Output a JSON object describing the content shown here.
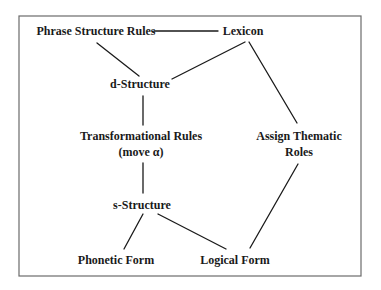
{
  "diagram": {
    "title": "",
    "frame": {
      "x": 19,
      "y": 16,
      "width": 342,
      "height": 260,
      "stroke": "#6b6b6b"
    },
    "nodes": [
      {
        "id": "phrase-structure-rules",
        "lines": [
          "Phrase Structure Rules"
        ],
        "x": 96,
        "y": 35
      },
      {
        "id": "lexicon",
        "lines": [
          "Lexicon"
        ],
        "x": 243,
        "y": 35
      },
      {
        "id": "d-structure",
        "lines": [
          "d-Structure"
        ],
        "x": 140,
        "y": 88
      },
      {
        "id": "transformational-rules",
        "lines": [
          "Transformational Rules",
          "(move α)"
        ],
        "x": 141,
        "y": 140
      },
      {
        "id": "assign-thematic-roles",
        "lines": [
          "Assign Thematic",
          "Roles"
        ],
        "x": 299,
        "y": 140
      },
      {
        "id": "s-structure",
        "lines": [
          "s-Structure"
        ],
        "x": 142,
        "y": 209
      },
      {
        "id": "phonetic-form",
        "lines": [
          "Phonetic Form"
        ],
        "x": 116,
        "y": 264
      },
      {
        "id": "logical-form",
        "lines": [
          "Logical Form"
        ],
        "x": 235,
        "y": 264
      }
    ],
    "edges": [
      {
        "from": "phrase-structure-rules",
        "to": "lexicon",
        "x1": 154,
        "y1": 31,
        "x2": 218,
        "y2": 31
      },
      {
        "from": "phrase-structure-rules",
        "to": "d-structure",
        "x1": 97,
        "y1": 43,
        "x2": 139,
        "y2": 76
      },
      {
        "from": "lexicon",
        "to": "d-structure",
        "x1": 245,
        "y1": 42,
        "x2": 172,
        "y2": 79
      },
      {
        "from": "lexicon",
        "to": "assign-thematic-roles",
        "x1": 249,
        "y1": 42,
        "x2": 297,
        "y2": 123
      },
      {
        "from": "d-structure",
        "to": "transformational-rules",
        "x1": 143,
        "y1": 96,
        "x2": 143,
        "y2": 125
      },
      {
        "from": "transformational-rules",
        "to": "s-structure",
        "x1": 143,
        "y1": 163,
        "x2": 143,
        "y2": 193
      },
      {
        "from": "s-structure",
        "to": "phonetic-form",
        "x1": 143,
        "y1": 214,
        "x2": 124,
        "y2": 249
      },
      {
        "from": "s-structure",
        "to": "logical-form",
        "x1": 158,
        "y1": 214,
        "x2": 226,
        "y2": 249
      },
      {
        "from": "assign-thematic-roles",
        "to": "logical-form",
        "x1": 298,
        "y1": 164,
        "x2": 250,
        "y2": 248
      }
    ],
    "colors": {
      "line": "#1a1a1a",
      "text": "#1a1a1a",
      "frame": "#6b6b6b",
      "background": "#ffffff"
    }
  }
}
